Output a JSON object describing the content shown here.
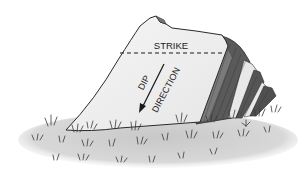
{
  "diagram": {
    "labels": {
      "strike": "STRIKE",
      "dip_line1": "DIP",
      "dip_line2": "DIRECTION"
    },
    "elements": {
      "strike_line": "dashed horizontal line across the bedding surface",
      "dip_arrow": "arrow pointing down-slope, perpendicular to strike"
    },
    "colors": {
      "rock_face": "#f0f0f0",
      "rock_outline": "#2a2a2a",
      "strata_dark": "#5a5a5a",
      "strata_light": "#e8e8e8",
      "ground": "#d4d4d4",
      "grass": "#3a3a3a",
      "background": "#ffffff"
    }
  }
}
